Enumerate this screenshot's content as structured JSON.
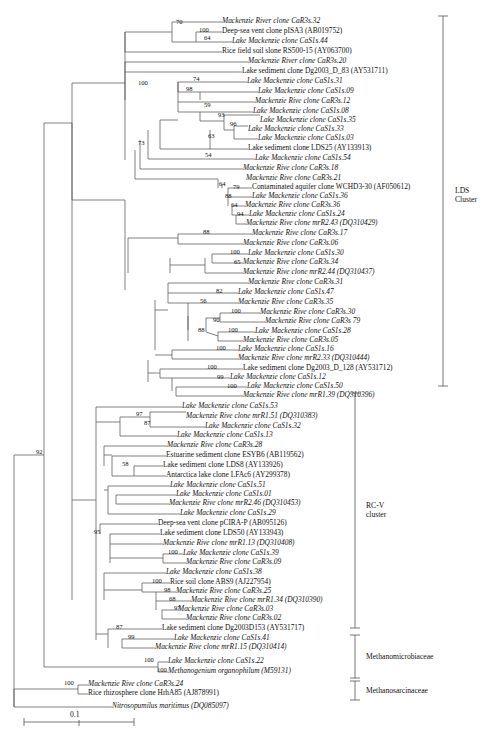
{
  "figure": {
    "kind": "phylogenetic-tree",
    "scale_bar": {
      "label": "0.1"
    },
    "clusters": [
      {
        "id": "lds",
        "line1": "LDS",
        "line2": "Cluster"
      },
      {
        "id": "rcv",
        "line1": "RC-V",
        "line2": "cluster"
      },
      {
        "id": "mmb",
        "line1": "Methanomicrobiaceae",
        "line2": ""
      },
      {
        "id": "msc",
        "line1": "Methanosarcinaceae",
        "line2": ""
      }
    ]
  },
  "taxa": [
    {
      "i": 0,
      "y": 22,
      "x": 222,
      "italic": true,
      "label": "Mackenzie River clone CaR3s.32"
    },
    {
      "i": 1,
      "y": 32,
      "x": 222,
      "italic": false,
      "label": "Deep-sea vent clone pISA3 (AB019752)"
    },
    {
      "i": 2,
      "y": 42,
      "x": 232,
      "italic": true,
      "label": "Lake Mackenzie clone CaS1s.44"
    },
    {
      "i": 3,
      "y": 52,
      "x": 222,
      "italic": false,
      "label": "Rice field soil slone RS500-15 (AY063700)"
    },
    {
      "i": 4,
      "y": 62,
      "x": 248,
      "italic": true,
      "label": "Mackenzie River clone CaR3s.20"
    },
    {
      "i": 5,
      "y": 72,
      "x": 242,
      "italic": false,
      "label": "Lake sediment clone Dg2003_D_83 (AY531711)"
    },
    {
      "i": 6,
      "y": 82,
      "x": 247,
      "italic": true,
      "label": "Lake Mackenzie clone CaS1s.31"
    },
    {
      "i": 7,
      "y": 92,
      "x": 258,
      "italic": true,
      "label": "Lake Mackenzie clone CaS1s.09"
    },
    {
      "i": 8,
      "y": 102,
      "x": 255,
      "italic": true,
      "label": "Mackenzie Rive clone CaR3s.12"
    },
    {
      "i": 9,
      "y": 112,
      "x": 253,
      "italic": true,
      "label": "Lake Mackenzie clone CaS1s.08"
    },
    {
      "i": 10,
      "y": 121,
      "x": 260,
      "italic": true,
      "label": "Lake Mackenzie clone CaS1s.35"
    },
    {
      "i": 11,
      "y": 130,
      "x": 248,
      "italic": true,
      "label": "Lake Mackenzie clone CaS1s.33"
    },
    {
      "i": 12,
      "y": 139,
      "x": 258,
      "italic": true,
      "label": "Lake Mackenzie clone CaS1s.03"
    },
    {
      "i": 13,
      "y": 149,
      "x": 248,
      "italic": false,
      "label": "Lake sediment clone LDS25 (AY133913)"
    },
    {
      "i": 14,
      "y": 159,
      "x": 255,
      "italic": true,
      "label": "Lake Mackenzie clone CaS1s.54"
    },
    {
      "i": 15,
      "y": 169,
      "x": 243,
      "italic": true,
      "label": "Mackenzie Rive clone CaR3s.18"
    },
    {
      "i": 16,
      "y": 179,
      "x": 246,
      "italic": true,
      "label": "Mackenzie Rive clone CaR3s.21"
    },
    {
      "i": 17,
      "y": 188,
      "x": 252,
      "italic": false,
      "label": "Contaminated aquifer clone WCHD3-30 (AF050612)"
    },
    {
      "i": 18,
      "y": 197,
      "x": 252,
      "italic": true,
      "label": "Lake Mackenzie clone CaS1s.36"
    },
    {
      "i": 19,
      "y": 206,
      "x": 245,
      "italic": true,
      "label": "Mackenzie Rive clone CaR3s.36"
    },
    {
      "i": 20,
      "y": 215,
      "x": 249,
      "italic": true,
      "label": "Lake Mackenzie clone CaS1s.24"
    },
    {
      "i": 21,
      "y": 224,
      "x": 246,
      "italic": true,
      "label": "Mackenzie Rive clone mrR2.43 (DQ310429)"
    },
    {
      "i": 22,
      "y": 234,
      "x": 252,
      "italic": true,
      "label": "Mackenzie Rive clone CaR3s.17"
    },
    {
      "i": 23,
      "y": 244,
      "x": 243,
      "italic": true,
      "label": "Mackenzie Rive clone CaR3s.06"
    },
    {
      "i": 24,
      "y": 254,
      "x": 248,
      "italic": true,
      "label": "Lake Mackenzie clone CaS1s.30"
    },
    {
      "i": 25,
      "y": 263,
      "x": 243,
      "italic": true,
      "label": "Mackenzie Rive clone CaR3s.34"
    },
    {
      "i": 26,
      "y": 273,
      "x": 243,
      "italic": true,
      "label": "Mackenzie Rive clone mrR2.44 (DQ310437)"
    },
    {
      "i": 27,
      "y": 283,
      "x": 248,
      "italic": true,
      "label": "Mackenzie Rive clone CaR3s.31"
    },
    {
      "i": 28,
      "y": 293,
      "x": 238,
      "italic": true,
      "label": "Lake Mackenzie clone CaS1s.47"
    },
    {
      "i": 29,
      "y": 303,
      "x": 238,
      "italic": true,
      "label": "Mackenzie Rive clone CaR3s.35"
    },
    {
      "i": 30,
      "y": 313,
      "x": 260,
      "italic": true,
      "label": "Mackenzie Rive clone CaR3s.30"
    },
    {
      "i": 31,
      "y": 322,
      "x": 265,
      "italic": true,
      "label": "Mackenzie Rive clone CaR3s 79"
    },
    {
      "i": 32,
      "y": 332,
      "x": 255,
      "italic": true,
      "label": "Lake Mackenzie clone CaS1s.28"
    },
    {
      "i": 33,
      "y": 341,
      "x": 243,
      "italic": true,
      "label": "Mackenzie Rive clone CaR3s.05"
    },
    {
      "i": 34,
      "y": 350,
      "x": 238,
      "italic": true,
      "label": "Lake Mackenzie clone CaS1s.16"
    },
    {
      "i": 35,
      "y": 359,
      "x": 238,
      "italic": true,
      "label": "Mackenzie Rive clone mrR2.33 (DQ310444)"
    },
    {
      "i": 36,
      "y": 369,
      "x": 243,
      "italic": false,
      "label": "Lake sediment clone Dg2003_D_128 (AY531712)"
    },
    {
      "i": 37,
      "y": 378,
      "x": 230,
      "italic": true,
      "label": "Lake Mackenzie clone CaS1s.12"
    },
    {
      "i": 38,
      "y": 387,
      "x": 247,
      "italic": true,
      "label": "Lake Mackenzie clone CaS1s.50"
    },
    {
      "i": 39,
      "y": 396,
      "x": 243,
      "italic": true,
      "label": "Mackenzie Rive clone mrR1.39 (DQ310396)"
    },
    {
      "i": 40,
      "y": 407,
      "x": 182,
      "italic": true,
      "label": "Lake Mackenzie clone CaS1s.53"
    },
    {
      "i": 41,
      "y": 417,
      "x": 186,
      "italic": true,
      "label": "Mackenzie Rive clone mrR1.51 (DQ310383)"
    },
    {
      "i": 42,
      "y": 427,
      "x": 205,
      "italic": true,
      "label": "Lake Mackenzie clone CaS1s.32"
    },
    {
      "i": 43,
      "y": 436,
      "x": 177,
      "italic": true,
      "label": "Lake Mackenzie clone CaS1s.13"
    },
    {
      "i": 44,
      "y": 446,
      "x": 167,
      "italic": true,
      "label": "Mackenzie Rive clone CaR3s.28"
    },
    {
      "i": 45,
      "y": 456,
      "x": 166,
      "italic": false,
      "label": "Estuarine sediment clone ESYB6 (AB119562)"
    },
    {
      "i": 46,
      "y": 466,
      "x": 163,
      "italic": false,
      "label": "Lake sediment clone LDS8 (AY133926)"
    },
    {
      "i": 47,
      "y": 476,
      "x": 166,
      "italic": false,
      "label": "Antarctica lake clone LFAc6 (AY299378)"
    },
    {
      "i": 48,
      "y": 486,
      "x": 170,
      "italic": true,
      "label": "Lake Mackenzie clone CaS1s.51"
    },
    {
      "i": 49,
      "y": 495,
      "x": 176,
      "italic": true,
      "label": "Lake Mackenzie clone CaS1s.01"
    },
    {
      "i": 50,
      "y": 504,
      "x": 169,
      "italic": true,
      "label": "Mackenzie Rive clone mrR2.46 (DQ310453)"
    },
    {
      "i": 51,
      "y": 514,
      "x": 180,
      "italic": true,
      "label": "Lake Mackenzie clone CaS1s.29"
    },
    {
      "i": 52,
      "y": 524,
      "x": 158,
      "italic": false,
      "label": "Deep-sea vent clone pCIRA-P (AB095126)"
    },
    {
      "i": 53,
      "y": 534,
      "x": 160,
      "italic": false,
      "label": "Lake sediment clone LDS50 (AY133943)"
    },
    {
      "i": 54,
      "y": 544,
      "x": 163,
      "italic": true,
      "label": "Mackenzie Rive clone mrR1.13 (DQ310408)"
    },
    {
      "i": 55,
      "y": 554,
      "x": 183,
      "italic": true,
      "label": "Lake Mackenzie clone CaS1s.39"
    },
    {
      "i": 56,
      "y": 563,
      "x": 186,
      "italic": true,
      "label": "Mackenzie Rive clone CaR3s.09"
    },
    {
      "i": 57,
      "y": 573,
      "x": 166,
      "italic": true,
      "label": "Lake Mackenzie clone CaS1s.38"
    },
    {
      "i": 58,
      "y": 583,
      "x": 170,
      "italic": false,
      "label": "Rice soil clone ABS9 (AJ227954)"
    },
    {
      "i": 59,
      "y": 592,
      "x": 176,
      "italic": true,
      "label": "Mackenzie Rive clone CaR3s.25"
    },
    {
      "i": 60,
      "y": 601,
      "x": 191,
      "italic": true,
      "label": "Mackenzie Rive clone mrR1.34 (DQ310390)"
    },
    {
      "i": 61,
      "y": 610,
      "x": 178,
      "italic": true,
      "label": "Mackenzie Rive clone CaR3s.03"
    },
    {
      "i": 62,
      "y": 619,
      "x": 186,
      "italic": true,
      "label": "Mackenzie Rive clone CaR3s.02"
    },
    {
      "i": 63,
      "y": 629,
      "x": 162,
      "italic": false,
      "label": "Lake sediment clone Dg2003D153 (AY531717)"
    },
    {
      "i": 64,
      "y": 639,
      "x": 174,
      "italic": true,
      "label": "Lake Mackenzie clone CaS1s.41"
    },
    {
      "i": 65,
      "y": 648,
      "x": 155,
      "italic": true,
      "label": "Mackenzie Rive clone mrR1.15 (DQ310414)"
    },
    {
      "i": 66,
      "y": 662,
      "x": 168,
      "italic": true,
      "label": "Lake Mackenzie clone CaS1s.22"
    },
    {
      "i": 67,
      "y": 672,
      "x": 168,
      "italic": true,
      "label": "Methanogenium organophilum (M59131)"
    },
    {
      "i": 68,
      "y": 685,
      "x": 88,
      "italic": true,
      "label": "Mackenzie Rive clone CaR3s.24"
    },
    {
      "i": 69,
      "y": 694,
      "x": 88,
      "italic": false,
      "label": "Rice rhizosphere clone HrhA85 (AJ878991)"
    },
    {
      "i": 70,
      "y": 707,
      "x": 112,
      "italic": true,
      "label": "Nitrosopumilus maritimus (DQ085097)"
    }
  ],
  "bootstraps": [
    {
      "v": "70",
      "x": 176,
      "y": 22
    },
    {
      "v": "100",
      "x": 199,
      "y": 30
    },
    {
      "v": "64",
      "x": 204,
      "y": 38
    },
    {
      "v": "100",
      "x": 138,
      "y": 83
    },
    {
      "v": "74",
      "x": 193,
      "y": 79
    },
    {
      "v": "98",
      "x": 186,
      "y": 89
    },
    {
      "v": "59",
      "x": 204,
      "y": 105
    },
    {
      "v": "93",
      "x": 218,
      "y": 115
    },
    {
      "v": "96",
      "x": 230,
      "y": 124
    },
    {
      "v": "63",
      "x": 208,
      "y": 136
    },
    {
      "v": "73",
      "x": 138,
      "y": 143
    },
    {
      "v": "54",
      "x": 205,
      "y": 155
    },
    {
      "v": "64",
      "x": 219,
      "y": 184
    },
    {
      "v": "79",
      "x": 233,
      "y": 187
    },
    {
      "v": "88",
      "x": 225,
      "y": 196
    },
    {
      "v": "64",
      "x": 231,
      "y": 205
    },
    {
      "v": "94",
      "x": 237,
      "y": 214
    },
    {
      "v": "88",
      "x": 203,
      "y": 232
    },
    {
      "v": "100",
      "x": 230,
      "y": 252
    },
    {
      "v": "65",
      "x": 234,
      "y": 262
    },
    {
      "v": "82",
      "x": 216,
      "y": 291
    },
    {
      "v": "56",
      "x": 200,
      "y": 301
    },
    {
      "v": "100",
      "x": 231,
      "y": 311
    },
    {
      "v": "90",
      "x": 213,
      "y": 320
    },
    {
      "v": "100",
      "x": 228,
      "y": 330
    },
    {
      "v": "88",
      "x": 198,
      "y": 330
    },
    {
      "v": "100",
      "x": 216,
      "y": 348
    },
    {
      "v": "100",
      "x": 207,
      "y": 367
    },
    {
      "v": "99",
      "x": 217,
      "y": 377
    },
    {
      "v": "100",
      "x": 227,
      "y": 386
    },
    {
      "v": "97",
      "x": 136,
      "y": 414
    },
    {
      "v": "87",
      "x": 144,
      "y": 423
    },
    {
      "v": "58",
      "x": 122,
      "y": 464
    },
    {
      "v": "92",
      "x": 36,
      "y": 452
    },
    {
      "v": "95",
      "x": 94,
      "y": 532
    },
    {
      "v": "100",
      "x": 168,
      "y": 552
    },
    {
      "v": "100",
      "x": 152,
      "y": 581
    },
    {
      "v": "98",
      "x": 164,
      "y": 590
    },
    {
      "v": "68",
      "x": 169,
      "y": 599
    },
    {
      "v": "97",
      "x": 174,
      "y": 608
    },
    {
      "v": "87",
      "x": 116,
      "y": 627
    },
    {
      "v": "99",
      "x": 128,
      "y": 637
    },
    {
      "v": "100",
      "x": 144,
      "y": 660
    },
    {
      "v": "100",
      "x": 157,
      "y": 670
    },
    {
      "v": "100",
      "x": 64,
      "y": 683
    }
  ]
}
